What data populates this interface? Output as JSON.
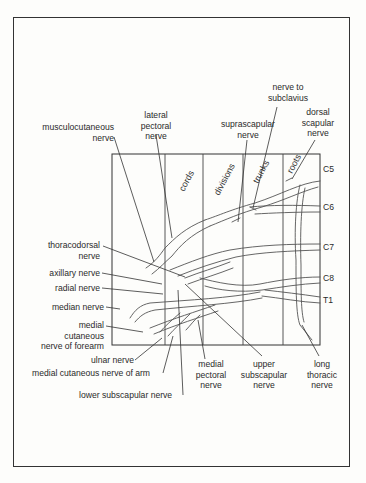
{
  "diagram": {
    "regions": [
      "cords",
      "divisions",
      "trunks",
      "roots"
    ],
    "spinal_roots": [
      "C5",
      "C6",
      "C7",
      "C8",
      "T1"
    ],
    "labels": {
      "musculocutaneous": [
        "musculocutaneous",
        "nerve"
      ],
      "lateral_pectoral": [
        "lateral",
        "pectoral",
        "nerve"
      ],
      "suprascapular": [
        "suprascapular",
        "nerve"
      ],
      "nerve_to_subclavius": [
        "nerve to",
        "subclavius"
      ],
      "dorsal_scapular": [
        "dorsal",
        "scapular",
        "nerve"
      ],
      "thoracodorsal": [
        "thoracodorsal",
        "nerve"
      ],
      "axillary": "axillary nerve",
      "radial": "radial nerve",
      "median": "median nerve",
      "medial_cutaneous_forearm": [
        "medial",
        "cutaneous",
        "nerve of forearm"
      ],
      "ulnar": "ulnar nerve",
      "medial_cutaneous_arm": "medial cutaneous nerve of arm",
      "lower_subscapular": "lower subscapular nerve",
      "medial_pectoral": [
        "medial",
        "pectoral",
        "nerve"
      ],
      "upper_subscapular": [
        "upper",
        "subscapular",
        "nerve"
      ],
      "long_thoracic": [
        "long",
        "thoracic",
        "nerve"
      ]
    }
  }
}
